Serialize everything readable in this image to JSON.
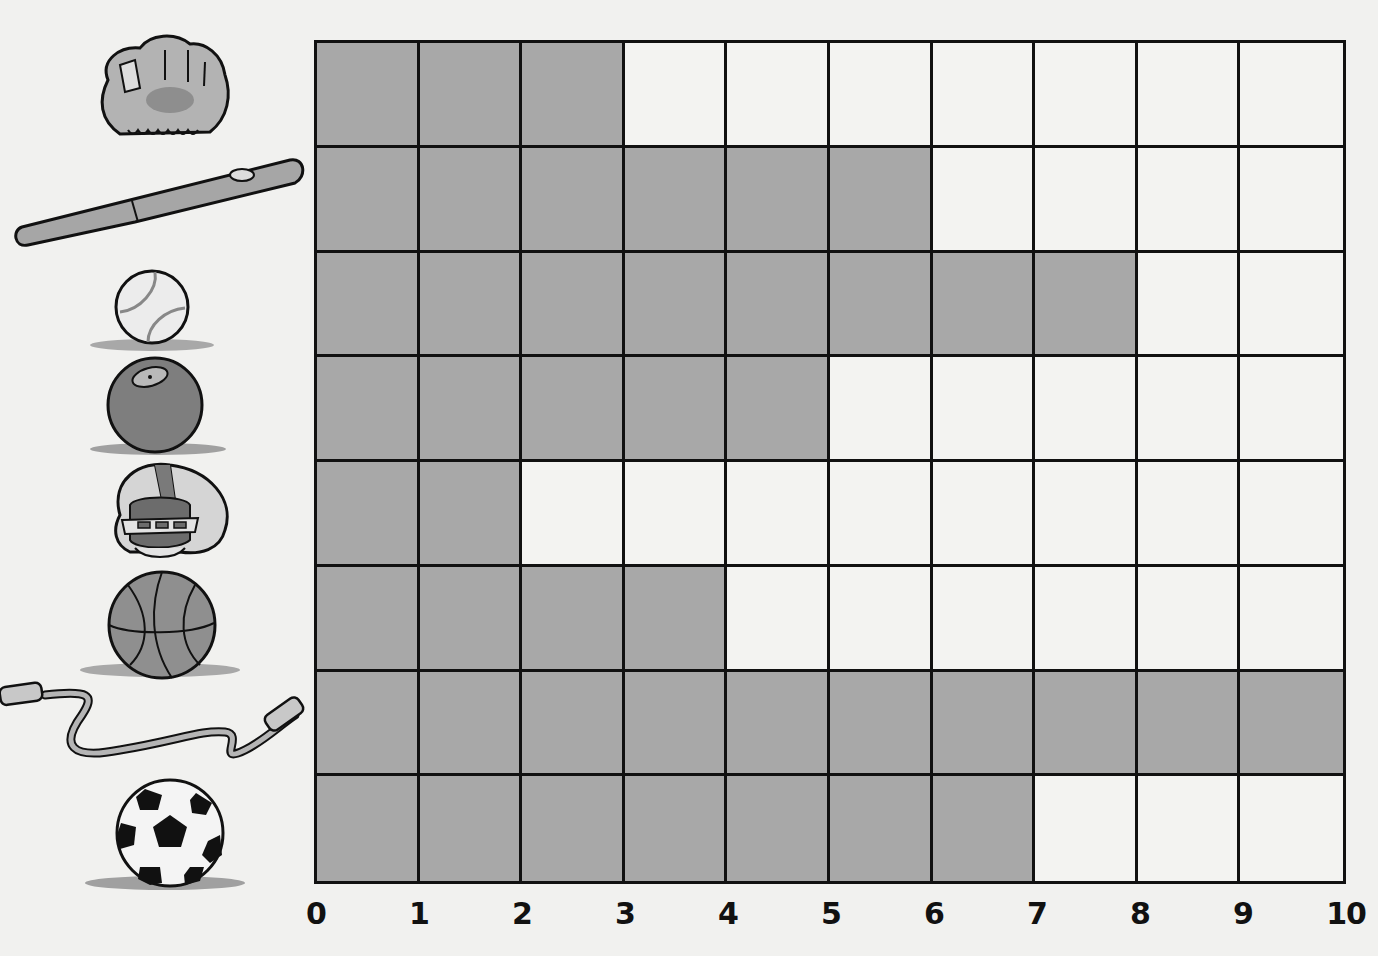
{
  "chart_data": {
    "type": "bar",
    "orientation": "horizontal",
    "title": "",
    "xlabel": "",
    "ylabel": "",
    "categories": [
      "baseball glove",
      "baseball bat",
      "baseball",
      "bowling ball",
      "football helmet",
      "basketball",
      "jump rope",
      "soccer ball"
    ],
    "values": [
      3,
      6,
      8,
      5,
      2,
      4,
      10,
      7
    ],
    "xlim": [
      0,
      10
    ],
    "x_ticks": [
      "0",
      "1",
      "2",
      "3",
      "4",
      "5",
      "6",
      "7",
      "8",
      "9",
      "10"
    ],
    "grid": true,
    "legend": "none",
    "category_labels_as_pictures": true
  },
  "colors": {
    "filled_cell": "#a8a8a8",
    "empty_cell": "#f3f3f1",
    "grid_line": "#111111",
    "background": "#f1f1ef"
  },
  "icons": [
    {
      "name": "baseball-glove-icon",
      "label": "baseball glove"
    },
    {
      "name": "baseball-bat-icon",
      "label": "baseball bat"
    },
    {
      "name": "baseball-icon",
      "label": "baseball"
    },
    {
      "name": "bowling-ball-icon",
      "label": "bowling ball"
    },
    {
      "name": "football-helmet-icon",
      "label": "football helmet"
    },
    {
      "name": "basketball-icon",
      "label": "basketball"
    },
    {
      "name": "jump-rope-icon",
      "label": "jump rope"
    },
    {
      "name": "soccer-ball-icon",
      "label": "soccer ball"
    }
  ]
}
